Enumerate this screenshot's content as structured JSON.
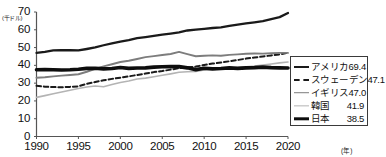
{
  "chart_data": {
    "type": "line",
    "title": "",
    "xlabel": "(年)",
    "ylabel": "(千ドル)",
    "xlim": [
      1990,
      2020
    ],
    "ylim": [
      0,
      70
    ],
    "xticks": [
      "1990",
      "1995",
      "2000",
      "2005",
      "2010",
      "2015",
      "2020"
    ],
    "yticks": [
      "0",
      "10",
      "20",
      "30",
      "40",
      "50",
      "60",
      "70"
    ],
    "grid": false,
    "legend_position": "right",
    "x": [
      1990,
      1991,
      1992,
      1993,
      1994,
      1995,
      1996,
      1997,
      1998,
      1999,
      2000,
      2001,
      2002,
      2003,
      2004,
      2005,
      2006,
      2007,
      2008,
      2009,
      2010,
      2011,
      2012,
      2013,
      2014,
      2015,
      2016,
      2017,
      2018,
      2019,
      2020
    ],
    "series": [
      {
        "name": "アメリカ",
        "end_value": 69.4,
        "color": "#1a1a1a",
        "style": "solid",
        "width": 2.3,
        "values": [
          47.0,
          47.6,
          48.4,
          48.5,
          48.6,
          48.4,
          49.2,
          50.1,
          51.3,
          52.4,
          53.4,
          54.2,
          55.3,
          55.9,
          56.6,
          57.3,
          57.9,
          58.6,
          59.6,
          60.1,
          60.5,
          61.0,
          61.4,
          62.2,
          62.9,
          63.6,
          64.2,
          64.9,
          66.0,
          67.1,
          69.4
        ]
      },
      {
        "name": "スウェーデン",
        "end_value": 47.1,
        "color": "#1a1a1a",
        "style": "dashed",
        "width": 2.0,
        "values": [
          28.5,
          28.0,
          27.8,
          27.7,
          27.9,
          28.2,
          29.6,
          30.6,
          31.6,
          32.4,
          33.1,
          33.8,
          34.6,
          35.4,
          36.2,
          36.8,
          37.6,
          38.4,
          38.9,
          39.3,
          40.2,
          41.0,
          41.6,
          42.3,
          43.0,
          43.8,
          44.4,
          45.0,
          45.6,
          46.2,
          47.1
        ]
      },
      {
        "name": "イギリス",
        "end_value": 47.0,
        "color": "#7d7d7d",
        "style": "solid",
        "width": 1.9,
        "values": [
          33.0,
          33.3,
          33.8,
          34.2,
          34.6,
          35.0,
          36.4,
          38.0,
          39.4,
          40.6,
          41.9,
          42.6,
          43.6,
          44.6,
          45.2,
          45.8,
          46.4,
          47.6,
          46.3,
          45.1,
          45.4,
          45.6,
          45.4,
          45.9,
          46.2,
          46.5,
          46.7,
          46.6,
          46.8,
          47.0,
          47.0
        ]
      },
      {
        "name": "韓国",
        "end_value": 41.9,
        "color": "#b4b4b4",
        "style": "solid",
        "width": 1.6,
        "values": [
          22.0,
          23.0,
          24.0,
          25.0,
          26.0,
          27.0,
          27.8,
          28.4,
          28.0,
          29.2,
          30.4,
          31.2,
          32.3,
          32.8,
          33.6,
          34.4,
          35.2,
          36.1,
          36.4,
          36.6,
          37.4,
          37.8,
          38.0,
          38.4,
          38.8,
          39.2,
          39.6,
          40.2,
          40.8,
          41.4,
          41.9
        ]
      },
      {
        "name": "日本",
        "end_value": 38.5,
        "color": "#0d0d0d",
        "style": "solid",
        "width": 3.6,
        "values": [
          37.5,
          37.6,
          37.5,
          37.4,
          37.5,
          37.8,
          38.3,
          38.4,
          38.0,
          38.2,
          38.8,
          38.3,
          38.5,
          38.6,
          39.0,
          39.2,
          39.3,
          39.3,
          38.6,
          37.6,
          38.4,
          38.0,
          38.2,
          38.6,
          38.3,
          38.6,
          38.7,
          39.0,
          38.7,
          38.6,
          38.5
        ]
      }
    ]
  },
  "axes": {
    "y_unit": "(千ドル)",
    "x_unit": "(年)"
  },
  "legend": {
    "items": [
      {
        "label": "アメリカ",
        "value": "69.4",
        "swatch": "sw-america"
      },
      {
        "label": "スウェーデン",
        "value": "47.1",
        "swatch": "sw-sweden"
      },
      {
        "label": "イギリス",
        "value": "47.0",
        "swatch": "sw-uk"
      },
      {
        "label": "韓国",
        "value": "41.9",
        "swatch": "sw-korea"
      },
      {
        "label": "日本",
        "value": "38.5",
        "swatch": "sw-japan"
      }
    ]
  }
}
